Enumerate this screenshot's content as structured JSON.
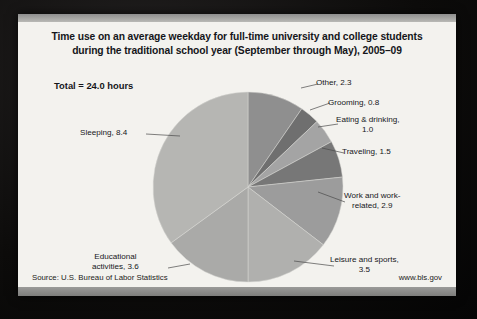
{
  "slide": {
    "title_line1": "Time use on an average weekday for full-time university and college students",
    "title_line2": "during the traditional school year (September through May), 2005–09",
    "total_note": "Total = 24.0  hours",
    "source": "Source: U.S. Bureau of Labor Statistics",
    "url": "www.bls.gov"
  },
  "chart_data": {
    "type": "pie",
    "title": "Time use on an average weekday for full-time university and college students during the traditional school year (September through May), 2005–09",
    "unit": "hours",
    "total": 24.0,
    "legend_position": "callout-labels",
    "start_angle_deg": 0,
    "direction": "clockwise",
    "categories": [
      "Other",
      "Grooming",
      "Eating & drinking",
      "Traveling",
      "Work and work-related",
      "Leisure and sports",
      "Educational activities",
      "Sleeping"
    ],
    "values": [
      2.3,
      0.8,
      1.0,
      1.5,
      2.9,
      3.5,
      3.6,
      8.4
    ],
    "colors": [
      "#8f8f8f",
      "#6f6f6f",
      "#a4a4a4",
      "#777777",
      "#9c9c9c",
      "#b0b0ae",
      "#aaaaa8",
      "#b6b6b3"
    ],
    "labels": [
      {
        "name": "Other",
        "text": "Other, 2.3",
        "value": 2.3
      },
      {
        "name": "Grooming",
        "text": "Grooming, 0.8",
        "value": 0.8
      },
      {
        "name": "Eating & drinking",
        "text": "Eating & drinking,\n1.0",
        "value": 1.0
      },
      {
        "name": "Traveling",
        "text": "Traveling, 1.5",
        "value": 1.5
      },
      {
        "name": "Work and work-related",
        "text": "Work and work-\nrelated, 2.9",
        "value": 2.9
      },
      {
        "name": "Leisure and sports",
        "text": "Leisure and sports,\n3.5",
        "value": 3.5
      },
      {
        "name": "Educational activities",
        "text": "Educational\nactivities, 3.6",
        "value": 3.6
      },
      {
        "name": "Sleeping",
        "text": "Sleeping, 8.4",
        "value": 8.4
      }
    ]
  }
}
